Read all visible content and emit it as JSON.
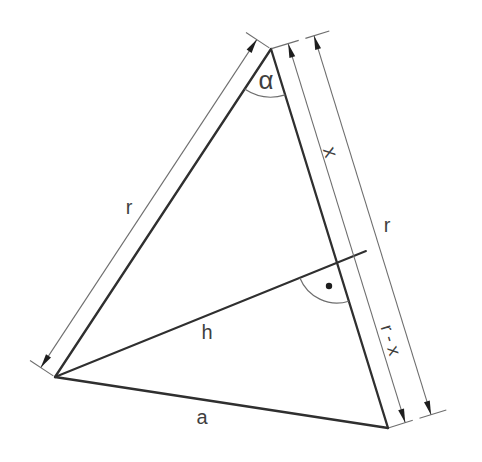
{
  "diagram": {
    "labels": {
      "alpha": "α",
      "r_left": "r",
      "x_dim": "x",
      "r_right": "r",
      "r_minus_x": "r - x",
      "h_altitude": "h",
      "a_base": "a"
    },
    "colors": {
      "thick_line": "#2f2f2f",
      "thin_line": "#6e6e6e",
      "arrow": "#1e1e1e",
      "text": "#3f3f3f",
      "background": "#ffffff"
    }
  }
}
